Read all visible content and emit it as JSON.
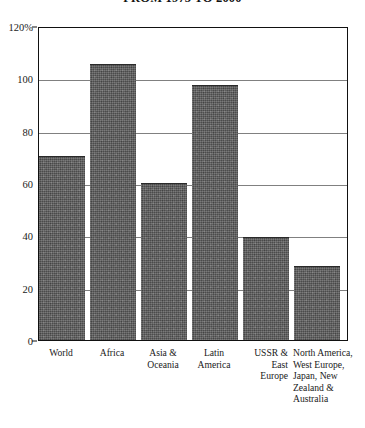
{
  "chart_data": {
    "type": "bar",
    "title": "FROM 1975 TO 2000",
    "xlabel": "",
    "ylabel": "",
    "ylim": [
      0,
      120
    ],
    "yticks": [
      0,
      20,
      40,
      60,
      80,
      100,
      120
    ],
    "ytick_labels": [
      "0",
      "20",
      "40",
      "60",
      "80",
      "100",
      "120%"
    ],
    "grid": true,
    "legend": "none",
    "categories": [
      "World",
      "Africa",
      "Asia & Oceania",
      "Latin America",
      "USSR & East Europe",
      "North America, West Europe, Japan, New Zealand & Australia"
    ],
    "values": [
      70,
      105,
      59.5,
      97,
      39,
      28
    ],
    "series": [
      {
        "name": "Population growth",
        "values": [
          70,
          105,
          59.5,
          97,
          39,
          28
        ]
      }
    ],
    "bar_color": "#5c5c5c",
    "frame_color": "#111111",
    "grid_color": "#555555"
  },
  "axis": {
    "tick_0": "0",
    "tick_20": "20",
    "tick_40": "40",
    "tick_60": "60",
    "tick_80": "80",
    "tick_100": "100",
    "tick_120": "120%"
  },
  "categories_display": {
    "c0": "World",
    "c1": "Africa",
    "c2": "Asia &\nOceania",
    "c3": "Latin\nAmerica",
    "c4": "USSR &\nEast\nEurope",
    "c5": "North America,\nWest Europe,\nJapan, New\nZealand &\nAustralia"
  }
}
